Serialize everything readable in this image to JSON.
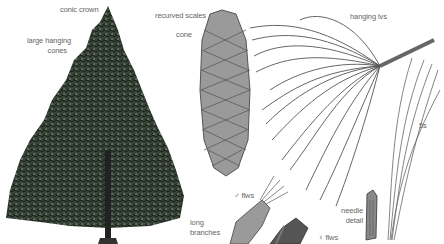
{
  "figure": {
    "labels": {
      "conic_crown": "conic crown",
      "large_hanging_cones_1": "large hanging",
      "large_hanging_cones_2": "cones",
      "recurved_scales": "recurved scales",
      "cone": "cone",
      "hanging_lvs": "hanging lvs",
      "five_s": "5s",
      "male_flws": "♂ flws",
      "long_branches_1": "long",
      "long_branches_2": "branches",
      "needle_detail_1": "needle",
      "needle_detail_2": "detail",
      "female_flws": "♀ flws"
    },
    "colors": {
      "foliage": "#2e3b2e",
      "cone": "#8a8a8a",
      "needles": "#555555",
      "label": "#666666"
    }
  }
}
